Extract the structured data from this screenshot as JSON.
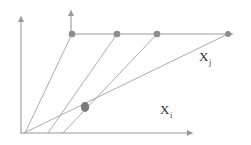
{
  "figure": {
    "background_color": "#ffffff",
    "line_color": "#9a9a9a",
    "dot_color": "#8d8d8d",
    "hub_color": "#7b7b7b",
    "label_color": "#2f2f2f",
    "width": 251,
    "height": 145
  },
  "labels": {
    "x_j": {
      "base": "X",
      "sub": "j",
      "x": 199,
      "y": 50
    },
    "x_i": {
      "base": "X",
      "sub": "i",
      "x": 160,
      "y": 103
    }
  },
  "chart_data": {
    "type": "scatter",
    "title": "",
    "xlabel": "X i",
    "ylabel": "",
    "grid": false,
    "legend": null,
    "axes": [
      {
        "name": "outer-y-axis",
        "orientation": "vertical",
        "x1": 21,
        "y1": 133,
        "x2": 21,
        "y2": 17,
        "arrow": "up"
      },
      {
        "name": "outer-x-axis",
        "orientation": "horizontal",
        "x1": 21,
        "y1": 133,
        "x2": 192,
        "y2": 133,
        "arrow": "right"
      },
      {
        "name": "inner-y-axis",
        "orientation": "vertical",
        "x1": 71,
        "y1": 34,
        "x2": 71,
        "y2": 11,
        "arrow": "up"
      },
      {
        "name": "inner-x-axis",
        "orientation": "horizontal",
        "x1": 71,
        "y1": 34,
        "x2": 232,
        "y2": 34,
        "arrow": "right"
      }
    ],
    "hub": {
      "name": "pencil-vertex",
      "x": 85,
      "y": 107,
      "rx": 4.2,
      "ry": 5.0
    },
    "points": [
      {
        "name": "point-1",
        "x": 72,
        "y": 34,
        "r": 3.3
      },
      {
        "name": "point-2",
        "x": 117,
        "y": 34,
        "r": 3.3
      },
      {
        "name": "point-3",
        "x": 157,
        "y": 34,
        "r": 3.3
      },
      {
        "name": "point-4",
        "x": 228,
        "y": 34,
        "r": 2.9
      }
    ],
    "rays": [
      {
        "name": "ray-1",
        "x1": 25,
        "y1": 133,
        "x2": 72,
        "y2": 34
      },
      {
        "name": "ray-2",
        "x1": 48,
        "y1": 133,
        "x2": 117,
        "y2": 34
      },
      {
        "name": "ray-3",
        "x1": 63,
        "y1": 133,
        "x2": 157,
        "y2": 34
      },
      {
        "name": "ray-4",
        "x1": 24,
        "y1": 133,
        "x2": 228,
        "y2": 34
      }
    ]
  }
}
